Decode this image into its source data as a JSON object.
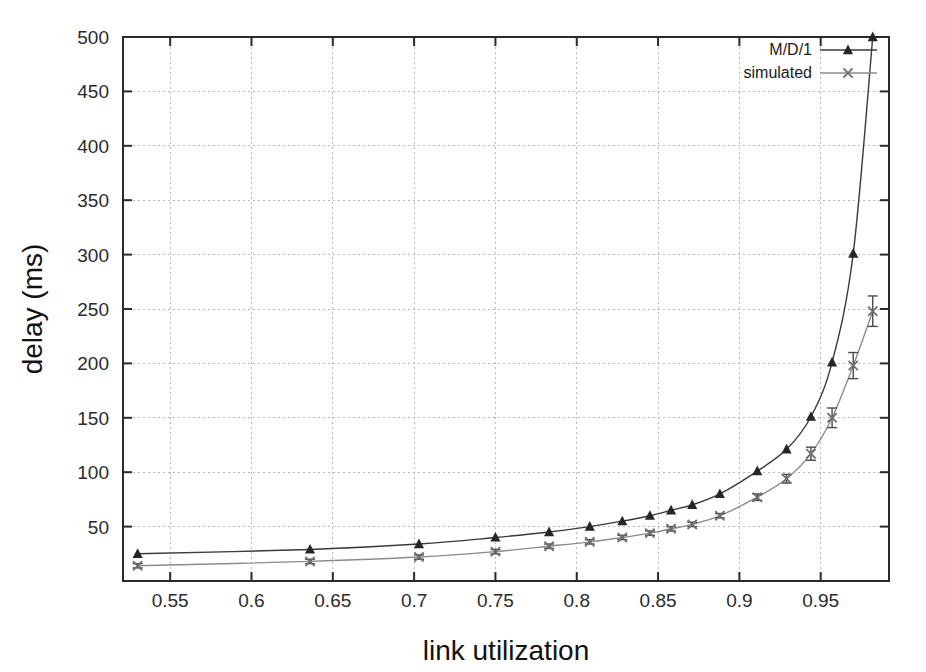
{
  "chart_data": {
    "type": "line",
    "title": "",
    "subtitle": "",
    "xlabel": "link utilization",
    "ylabel": "delay (ms)",
    "xlim": [
      0.521,
      0.992
    ],
    "ylim": [
      0,
      500
    ],
    "xticks": [
      0.55,
      0.6,
      0.65,
      0.7,
      0.75,
      0.8,
      0.85,
      0.9,
      0.95
    ],
    "xtick_labels": [
      "0.55",
      "0.6",
      "0.65",
      "0.7",
      "0.75",
      "0.8",
      "0.85",
      "0.9",
      "0.95"
    ],
    "yticks": [
      50,
      100,
      150,
      200,
      250,
      300,
      350,
      400,
      450,
      500
    ],
    "ytick_labels": [
      "50",
      "100",
      "150",
      "200",
      "250",
      "300",
      "350",
      "400",
      "450",
      "500"
    ],
    "grid": true,
    "legend_position": "top-right",
    "legend_entries": [
      "M/D/1",
      "simulated"
    ],
    "series": [
      {
        "name": "M/D/1",
        "marker": "triangle",
        "color": "#262626",
        "x": [
          0.53,
          0.636,
          0.703,
          0.75,
          0.783,
          0.808,
          0.828,
          0.845,
          0.858,
          0.871,
          0.888,
          0.911,
          0.929,
          0.944,
          0.957,
          0.97,
          0.982
        ],
        "values": [
          25,
          29,
          34,
          40,
          45,
          50,
          55,
          60,
          65,
          70,
          80,
          101,
          121,
          151,
          201,
          301,
          500
        ]
      },
      {
        "name": "simulated",
        "marker": "x",
        "color": "#6f6f6f",
        "x": [
          0.53,
          0.636,
          0.703,
          0.75,
          0.783,
          0.808,
          0.828,
          0.845,
          0.858,
          0.871,
          0.888,
          0.911,
          0.929,
          0.944,
          0.957,
          0.97,
          0.982
        ],
        "values": [
          14,
          18,
          22,
          27,
          32,
          36,
          40,
          44,
          48,
          52,
          60,
          77,
          94,
          117,
          150,
          198,
          248
        ],
        "errors": [
          2,
          2,
          2,
          2,
          2,
          2,
          2,
          2,
          2,
          2,
          2,
          3,
          4,
          6,
          9,
          12,
          14
        ]
      }
    ]
  }
}
